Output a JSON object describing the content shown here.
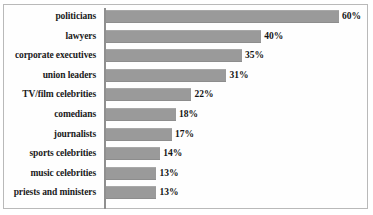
{
  "chart_data": {
    "type": "bar",
    "orientation": "horizontal",
    "title": "",
    "subtitle": "",
    "xlabel": "",
    "ylabel": "",
    "xlim": [
      0,
      60
    ],
    "grid": false,
    "legend": null,
    "value_suffix": "%",
    "bar_color": "#9a9a9a",
    "categories": [
      "politicians",
      "lawyers",
      "corporate executives",
      "union leaders",
      "TV/film celebrities",
      "comedians",
      "journalists",
      "sports celebrities",
      "music celebrities",
      "priests and ministers"
    ],
    "values": [
      60,
      40,
      35,
      31,
      22,
      18,
      17,
      14,
      13,
      13
    ],
    "value_labels": [
      "60%",
      "40%",
      "35%",
      "31%",
      "22%",
      "18%",
      "17%",
      "14%",
      "13%",
      "13%"
    ]
  }
}
